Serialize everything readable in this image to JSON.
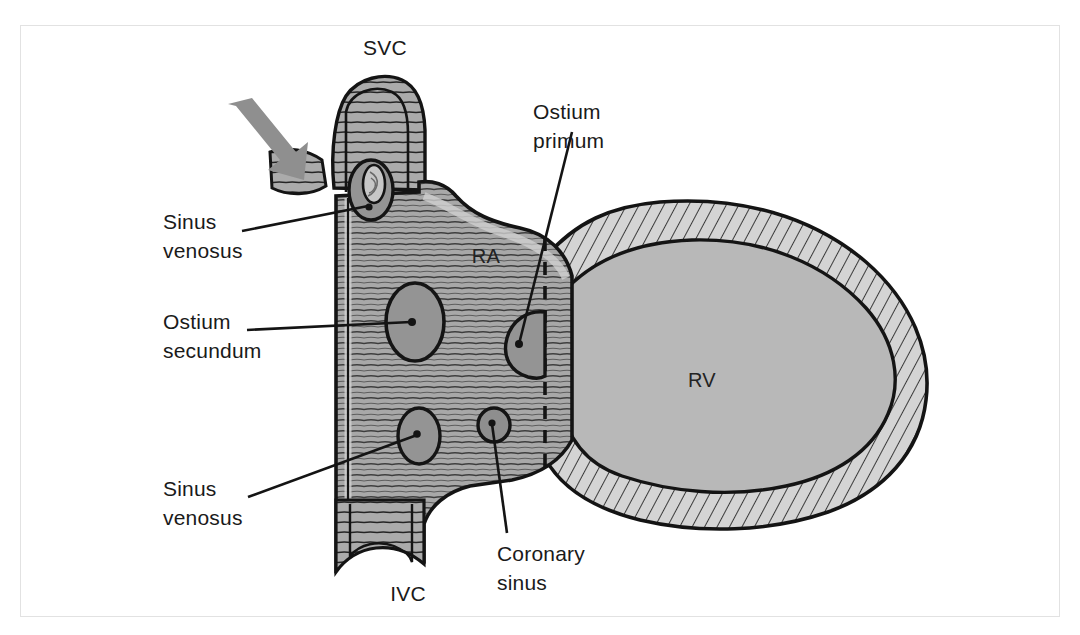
{
  "figure": {
    "background_color": "#ffffff",
    "frame_color": "#e2e2e2"
  },
  "colors": {
    "outline": "#141414",
    "atrial_wall_fill": "#a8a8a8",
    "atrial_wall_light": "#c2c2c2",
    "chamber_fill": "#b5b5b5",
    "ostium_fill": "#949494",
    "ventricle_wall_fill": "#d0d0d0",
    "ventricle_cavity_fill": "#b8b8b8",
    "arrow_color": "#8f8f8f",
    "hatch_color": "#1f1f1f",
    "label_color": "#1a1a1a"
  },
  "labels": {
    "svc": "SVC",
    "ivc": "IVC",
    "ra": "RA",
    "rv": "RV",
    "sinus_venosus_upper_line1": "Sinus",
    "sinus_venosus_upper_line2": "venosus",
    "ostium_secundum_line1": "Ostium",
    "ostium_secundum_line2": "secundum",
    "sinus_venosus_lower_line1": "Sinus",
    "sinus_venosus_lower_line2": "venosus",
    "ostium_primum_line1": "Ostium",
    "ostium_primum_line2": "primum",
    "coronary_sinus_line1": "Coronary",
    "coronary_sinus_line2": "sinus"
  },
  "structures": [
    {
      "name": "superior-vena-cava",
      "abbreviation": "SVC",
      "description": "Superior vena cava entering the top of the right atrium"
    },
    {
      "name": "inferior-vena-cava",
      "abbreviation": "IVC",
      "description": "Inferior vena cava entering the bottom of the right atrium"
    },
    {
      "name": "right-atrium",
      "abbreviation": "RA",
      "description": "Right atrial chamber with trabeculated wall"
    },
    {
      "name": "right-ventricle",
      "abbreviation": "RV",
      "description": "Right ventricular chamber with thick hatched myocardial wall"
    },
    {
      "name": "sinus-venosus-defect-superior",
      "description": "Sinus venosus defect near the SVC orifice"
    },
    {
      "name": "ostium-secundum-defect",
      "description": "Ostium secundum atrial septal defect in mid septum"
    },
    {
      "name": "sinus-venosus-defect-inferior",
      "description": "Sinus venosus defect near the IVC orifice"
    },
    {
      "name": "ostium-primum-defect",
      "description": "Ostium primum defect low in the atrial septum"
    },
    {
      "name": "coronary-sinus-defect",
      "description": "Coronary sinus orifice / unroofed coronary sinus defect"
    },
    {
      "name": "anomalous-vein-arrow",
      "description": "Gray arrow indicating anomalous pulmonary venous connection entering the SVC"
    },
    {
      "name": "atrioventricular-septum-dashed-line",
      "description": "Dashed line marking the plane of the atrioventricular septum"
    }
  ]
}
